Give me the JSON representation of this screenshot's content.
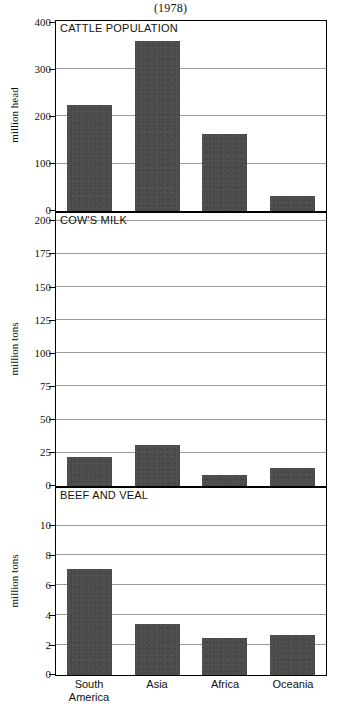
{
  "figure": {
    "title": "(1978)",
    "categories": [
      "South America",
      "Asia",
      "Africa",
      "Oceania"
    ],
    "category_lines": [
      [
        "South",
        "America"
      ],
      [
        "Asia",
        ""
      ],
      [
        "Africa",
        ""
      ],
      [
        "Oceania",
        ""
      ]
    ],
    "bar_color": "#4b4b4b",
    "grid_color": "#9a9a9a",
    "frame_color": "#000000"
  },
  "chart_data": [
    {
      "type": "bar",
      "title": "CATTLE POPULATION",
      "xlabel": "",
      "ylabel": "million head",
      "categories": [
        "South America",
        "Asia",
        "Africa",
        "Oceania"
      ],
      "values": [
        225,
        360,
        163,
        31
      ],
      "ylim": [
        0,
        400
      ],
      "yticks": [
        0,
        100,
        200,
        300,
        400
      ],
      "ytick_labels": [
        "0",
        "100",
        "200",
        "300",
        "400"
      ],
      "grid": true,
      "legend": "none"
    },
    {
      "type": "bar",
      "title": "COW'S MILK",
      "xlabel": "",
      "ylabel": "million tons",
      "categories": [
        "South America",
        "Asia",
        "Africa",
        "Oceania"
      ],
      "values": [
        22,
        31,
        8.5,
        13.5
      ],
      "ylim": [
        0,
        205
      ],
      "yticks": [
        0,
        25,
        50,
        75,
        100,
        125,
        150,
        175,
        200
      ],
      "ytick_labels": [
        "0",
        "25",
        "50",
        "75",
        "100",
        "125",
        "150",
        "175",
        "200"
      ],
      "grid": true,
      "legend": "none"
    },
    {
      "type": "bar",
      "title": "BEEF AND VEAL",
      "xlabel": "",
      "ylabel": "million tons",
      "categories": [
        "South America",
        "Asia",
        "Africa",
        "Oceania"
      ],
      "values": [
        7.1,
        3.45,
        2.5,
        2.7
      ],
      "ylim": [
        0,
        12.45
      ],
      "yticks": [
        0,
        2,
        4,
        6,
        8,
        10
      ],
      "ytick_labels": [
        "0",
        "2",
        "4",
        "6",
        "8",
        "10"
      ],
      "grid": true,
      "legend": "none"
    }
  ]
}
